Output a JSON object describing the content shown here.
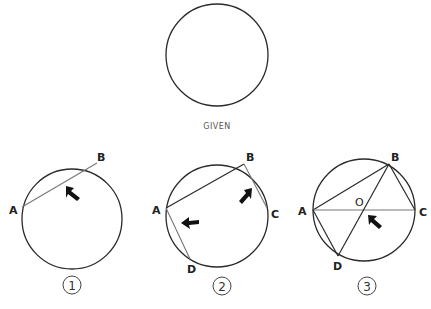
{
  "given": {
    "caption": "GIVEN"
  },
  "steps": [
    {
      "number": "1",
      "labels": {
        "A": "A",
        "B": "B"
      }
    },
    {
      "number": "2",
      "labels": {
        "A": "A",
        "B": "B",
        "C": "C",
        "D": "D"
      }
    },
    {
      "number": "3",
      "labels": {
        "A": "A",
        "B": "B",
        "C": "C",
        "D": "D",
        "O": "O"
      }
    }
  ],
  "colors": {
    "stroke": "#2a2a2a",
    "chord": "#777777",
    "arrow": "#111111"
  }
}
